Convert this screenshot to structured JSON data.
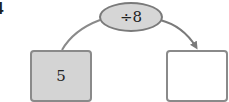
{
  "question_number": "4",
  "operation": {
    "label": "÷8"
  },
  "input_box": {
    "value": "5"
  },
  "output_box": {
    "value": ""
  },
  "colors": {
    "input_fill": "#d4d4d4",
    "oval_fill": "#d6d6d6",
    "border": "#8a8a8a",
    "arrow": "#7a7a7a"
  }
}
